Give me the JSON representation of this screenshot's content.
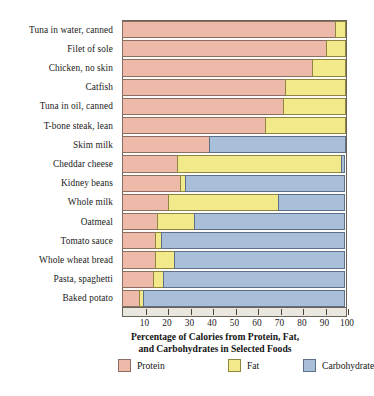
{
  "chart_data": {
    "type": "bar",
    "subtype": "stacked-horizontal-100pct",
    "title_line1": "Percentage of Calories from Protein, Fat,",
    "title_line2": "and Carbohydrates in Selected Foods",
    "xlabel": "Percentage of Calories from Protein, Fat, and Carbohydrates in Selected Foods",
    "ylabel": "",
    "xlim": [
      0,
      100
    ],
    "grid": false,
    "legend_position": "bottom",
    "xticks": [
      10,
      20,
      30,
      40,
      50,
      60,
      70,
      80,
      90,
      100
    ],
    "xticklabels": [
      "10",
      "20",
      "30",
      "40",
      "50",
      "60",
      "70",
      "80",
      "90",
      "100"
    ],
    "categories": [
      "Tuna in water, canned",
      "Filet of sole",
      "Chicken, no skin",
      "Catfish",
      "Tuna in oil, canned",
      "T-bone steak, lean",
      "Skim milk",
      "Cheddar cheese",
      "Kidney beans",
      "Whole milk",
      "Oatmeal",
      "Tomato sauce",
      "Whole wheat bread",
      "Pasta, spaghetti",
      "Baked potato"
    ],
    "series": [
      {
        "name": "Protein",
        "color": "#edb9a8",
        "values": [
          95,
          91,
          85,
          73,
          72,
          64,
          39,
          25,
          26,
          21,
          16,
          15,
          15,
          14,
          8
        ]
      },
      {
        "name": "Fat",
        "color": "#f2e98a",
        "values": [
          5,
          9,
          15,
          27,
          28,
          36,
          0,
          73,
          3,
          49,
          17,
          3,
          9,
          5,
          2
        ]
      },
      {
        "name": "Carbohydrate",
        "color": "#a9bfd9",
        "values": [
          0,
          0,
          0,
          0,
          0,
          0,
          61,
          2,
          71,
          30,
          67,
          82,
          76,
          81,
          90
        ]
      }
    ],
    "legend": [
      {
        "label": "Protein",
        "color": "#edb9a8",
        "swatch": "sw-protein"
      },
      {
        "label": "Fat",
        "color": "#f2e98a",
        "swatch": "sw-fat"
      },
      {
        "label": "Carbohydrate",
        "color": "#a9bfd9",
        "swatch": "sw-carb"
      }
    ]
  },
  "colors": {
    "protein": "#edb9a8",
    "fat": "#f2e98a",
    "carbohydrate": "#a9bfd9",
    "frame": "#6b6257",
    "axis_band": "#e9e7e0",
    "text": "#151515",
    "background": "#ffffff"
  }
}
